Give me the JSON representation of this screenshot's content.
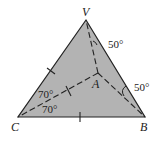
{
  "diagram": {
    "type": "geometry-tetrahedron-face",
    "fill_color": "#b3b3b3",
    "stroke_color": "#222222",
    "vertices": {
      "V": {
        "label": "V",
        "x": 86,
        "y": 20
      },
      "C": {
        "label": "C",
        "x": 18,
        "y": 117
      },
      "B": {
        "label": "B",
        "x": 145,
        "y": 117
      },
      "A": {
        "label": "A",
        "x": 98,
        "y": 73
      }
    },
    "labels": {
      "V": "V",
      "C": "C",
      "B": "B",
      "A": "A"
    },
    "edges_solid": [
      [
        "V",
        "C"
      ],
      [
        "V",
        "B"
      ],
      [
        "C",
        "B"
      ]
    ],
    "edges_dashed": [
      [
        "A",
        "V"
      ],
      [
        "A",
        "C"
      ],
      [
        "A",
        "B"
      ]
    ],
    "equal_tick_edges": [
      [
        "V",
        "C"
      ],
      [
        "C",
        "A"
      ],
      [
        "C",
        "B"
      ]
    ],
    "angles": {
      "at_V": "50°",
      "at_B": "50°",
      "at_C_upper": "70°",
      "at_C_lower": "70°"
    }
  }
}
